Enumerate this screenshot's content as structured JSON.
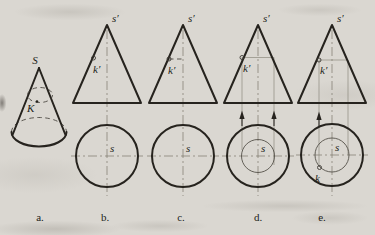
{
  "colors": {
    "paper": "#dad7d1",
    "ink": "#26231e",
    "construction": "#7b776c"
  },
  "panels": [
    {
      "caption": "a.",
      "apex_label": "S",
      "point_label": "K"
    },
    {
      "caption": "b.",
      "apex_label": "s′",
      "front_point_label": "k′",
      "top_center_label": "s"
    },
    {
      "caption": "c.",
      "apex_label": "s′",
      "front_point_label": "k′",
      "top_center_label": "s"
    },
    {
      "caption": "d.",
      "apex_label": "s′",
      "front_point_label": "k′",
      "top_center_label": "s"
    },
    {
      "caption": "e.",
      "apex_label": "s′",
      "front_point_label": "k′",
      "top_center_label": "s",
      "top_point_label": "k"
    }
  ]
}
